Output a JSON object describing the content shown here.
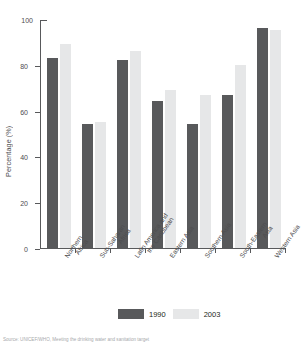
{
  "chart_data": {
    "type": "bar",
    "title": "",
    "xlabel": "",
    "ylabel": "Percentage (%)",
    "ylim": [
      0,
      100
    ],
    "yticks": [
      0,
      20,
      40,
      60,
      80,
      100
    ],
    "grid": false,
    "legend_position": "bottom",
    "categories": [
      "Northern Africa",
      "Sub-Saharan Africa",
      "Latin America and the Caribbean",
      "Eastern Asia",
      "Southern Asia",
      "South-Eastern Asia",
      "Western Asia"
    ],
    "category_lines": [
      [
        "Northern",
        "Africa"
      ],
      [
        "Sub-Saharan",
        "Africa"
      ],
      [
        "Latin America and",
        "the Caribbean"
      ],
      [
        "Eastern Asia"
      ],
      [
        "Southern Asia"
      ],
      [
        "South-Eastern",
        "Asia"
      ],
      [
        "Western Asia"
      ]
    ],
    "series": [
      {
        "name": "1990",
        "color": "#58595b",
        "values": [
          83,
          54,
          82,
          64,
          54,
          67,
          96
        ]
      },
      {
        "name": "2003",
        "color": "#e6e7e8",
        "values": [
          89,
          55,
          86,
          69,
          67,
          80,
          95
        ]
      }
    ]
  },
  "legend": {
    "items": [
      {
        "label": "1990"
      },
      {
        "label": "2003"
      }
    ]
  },
  "source": {
    "text": "Source: UNICEF/WHO, Meeting the drinking water and sanitation target"
  }
}
